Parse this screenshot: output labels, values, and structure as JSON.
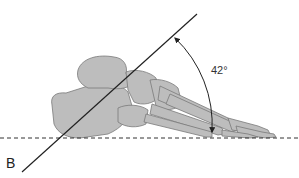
{
  "figure": {
    "angle_label": "42°",
    "point_label": "B",
    "colors": {
      "bone_fill": "#bdbdbd",
      "bone_stroke": "#7a7a7a",
      "line": "#222222",
      "dashed_baseline": "#333333",
      "background": "#ffffff"
    }
  }
}
